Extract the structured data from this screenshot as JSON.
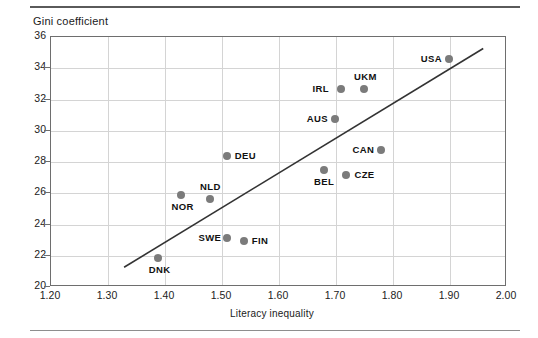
{
  "figure": {
    "ylabel": "Gini coefficient",
    "xlabel": "Literacy inequality"
  },
  "chart_data": {
    "type": "scatter",
    "title": "",
    "xlabel": "Literacy inequality",
    "ylabel": "Gini coefficient",
    "xlim": [
      1.2,
      2.0
    ],
    "ylim": [
      20,
      36
    ],
    "xticks": [
      "1.20",
      "1.30",
      "1.40",
      "1.50",
      "1.60",
      "1.70",
      "1.80",
      "1.90",
      "2.00"
    ],
    "yticks": [
      "20",
      "22",
      "24",
      "26",
      "28",
      "30",
      "32",
      "34",
      "36"
    ],
    "grid": true,
    "legend": "none",
    "marker_color": "#7b7b7b",
    "trendline": {
      "present": true,
      "color": "#333333",
      "x_start": 1.33,
      "y_start": 21.2,
      "x_end": 1.96,
      "y_end": 35.2
    },
    "points": [
      {
        "label": "DNK",
        "x": 1.39,
        "y": 21.8,
        "label_pos": "below"
      },
      {
        "label": "SWE",
        "x": 1.51,
        "y": 23.1,
        "label_pos": "left"
      },
      {
        "label": "FIN",
        "x": 1.54,
        "y": 22.9,
        "label_pos": "right"
      },
      {
        "label": "NOR",
        "x": 1.43,
        "y": 25.8,
        "label_pos": "below"
      },
      {
        "label": "NLD",
        "x": 1.48,
        "y": 25.6,
        "label_pos": "above"
      },
      {
        "label": "CZE",
        "x": 1.72,
        "y": 27.1,
        "label_pos": "right"
      },
      {
        "label": "BEL",
        "x": 1.68,
        "y": 27.4,
        "label_pos": "below"
      },
      {
        "label": "DEU",
        "x": 1.51,
        "y": 28.3,
        "label_pos": "right"
      },
      {
        "label": "CAN",
        "x": 1.78,
        "y": 28.7,
        "label_pos": "left"
      },
      {
        "label": "AUS",
        "x": 1.7,
        "y": 30.7,
        "label_pos": "left"
      },
      {
        "label": "IRL",
        "x": 1.71,
        "y": 32.6,
        "label_pos": "left"
      },
      {
        "label": "UKM",
        "x": 1.75,
        "y": 32.6,
        "label_pos": "above"
      },
      {
        "label": "USA",
        "x": 1.9,
        "y": 34.5,
        "label_pos": "left"
      }
    ]
  }
}
